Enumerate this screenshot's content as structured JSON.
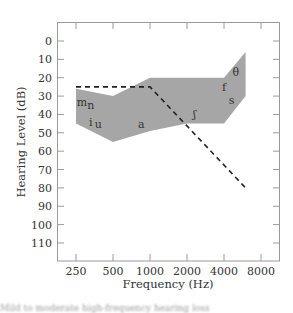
{
  "chart_data": {
    "type": "area",
    "title": "",
    "xlabel": "Frequency (Hz)",
    "ylabel": "Hearing Level (dB)",
    "x_categories": [
      "250",
      "500",
      "1000",
      "2000",
      "4000",
      "8000"
    ],
    "x_scale": "log2",
    "y_ticks": [
      0,
      10,
      20,
      30,
      40,
      50,
      60,
      70,
      80,
      90,
      100,
      110
    ],
    "ylim": [
      -7,
      118
    ],
    "y_inverted": true,
    "grid": false,
    "speech_banana": {
      "name": "Speech sounds region",
      "color": "#a6a6a6",
      "upper_boundary": [
        {
          "freq": 250,
          "db": 26
        },
        {
          "freq": 500,
          "db": 30
        },
        {
          "freq": 1000,
          "db": 20
        },
        {
          "freq": 4000,
          "db": 20
        },
        {
          "freq": 6000,
          "db": 6
        }
      ],
      "lower_boundary": [
        {
          "freq": 250,
          "db": 45
        },
        {
          "freq": 500,
          "db": 55
        },
        {
          "freq": 1000,
          "db": 49
        },
        {
          "freq": 2000,
          "db": 45
        },
        {
          "freq": 4000,
          "db": 45
        },
        {
          "freq": 6000,
          "db": 30
        }
      ]
    },
    "hearing_threshold_line": {
      "style": "dashed",
      "color": "#222222",
      "points": [
        {
          "freq": 250,
          "db": 25
        },
        {
          "freq": 1000,
          "db": 25
        },
        {
          "freq": 6000,
          "db": 80
        }
      ]
    },
    "phoneme_labels": [
      {
        "text": "m",
        "freq": 280,
        "db": 33
      },
      {
        "text": "n",
        "freq": 330,
        "db": 35
      },
      {
        "text": "i",
        "freq": 330,
        "db": 44
      },
      {
        "text": "u",
        "freq": 380,
        "db": 45
      },
      {
        "text": "a",
        "freq": 850,
        "db": 45
      },
      {
        "text": "ʃ",
        "freq": 2300,
        "db": 40
      },
      {
        "text": "f",
        "freq": 4000,
        "db": 25
      },
      {
        "text": "s",
        "freq": 4600,
        "db": 32
      },
      {
        "text": "θ",
        "freq": 5000,
        "db": 17
      }
    ]
  },
  "caption": "Mild to moderate high-frequency hearing loss"
}
